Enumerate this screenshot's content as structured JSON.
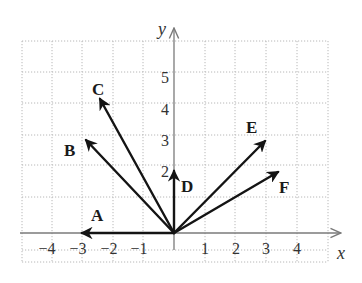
{
  "figure": {
    "type": "vector-diagram",
    "axes": {
      "x_label": "x",
      "y_label": "y",
      "x_ticks": [
        "−4",
        "−3",
        "−2",
        "−1",
        "1",
        "2",
        "3",
        "4"
      ],
      "y_ticks": [
        "2",
        "3",
        "4",
        "5"
      ],
      "x_range": [
        -5,
        5
      ],
      "y_range": [
        -0.5,
        6
      ]
    },
    "vectors": [
      {
        "label": "A",
        "from": [
          0,
          0
        ],
        "to": [
          -3,
          0
        ]
      },
      {
        "label": "B",
        "from": [
          0,
          0
        ],
        "to": [
          -2.9,
          3
        ]
      },
      {
        "label": "C",
        "from": [
          0,
          0
        ],
        "to": [
          -2.4,
          4.3
        ]
      },
      {
        "label": "D",
        "from": [
          0,
          0
        ],
        "to": [
          0,
          2
        ]
      },
      {
        "label": "E",
        "from": [
          0,
          0
        ],
        "to": [
          3,
          3
        ]
      },
      {
        "label": "F",
        "from": [
          0,
          0
        ],
        "to": [
          3.4,
          2
        ]
      }
    ],
    "colors": {
      "vector": "#141414",
      "axis": "#7a7a7a",
      "grid": "#b8b8b8",
      "text": "#333333"
    }
  }
}
